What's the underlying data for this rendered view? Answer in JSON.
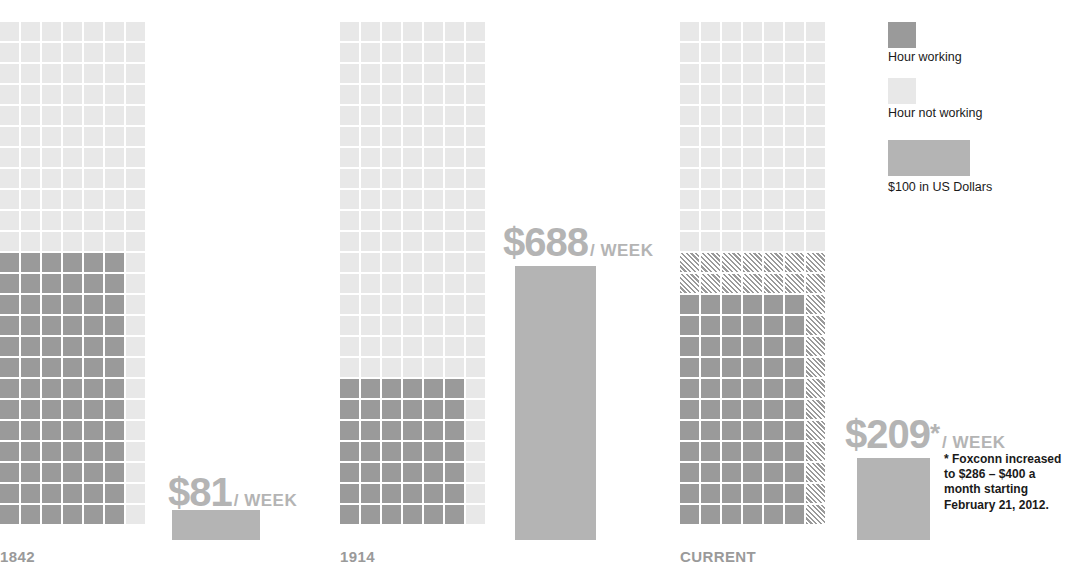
{
  "chart_data": {
    "type": "bar",
    "title": "",
    "subtitle": "",
    "xlabel": "",
    "ylabel": "",
    "categories": [
      "1842",
      "1914",
      "CURRENT"
    ],
    "series": [
      {
        "name": "Weekly wage (US Dollars)",
        "values": [
          81,
          688,
          209
        ],
        "labels": [
          "$81",
          "$688",
          "$209"
        ]
      },
      {
        "name": "Hours working per week",
        "values": [
          78,
          42,
          78
        ],
        "note": "waffle grid: dark cells = hours working"
      },
      {
        "name": "Hours not working per week",
        "values": [
          90,
          126,
          90
        ],
        "note": "waffle grid: light cells = hours not working"
      }
    ],
    "waffle": {
      "columns": 7,
      "rows": 24,
      "groups": [
        {
          "category": "1842",
          "off_rows": 11,
          "hatch_rows": 0,
          "on_rows": 13,
          "on_cols": 6,
          "tail_state": "off"
        },
        {
          "category": "1914",
          "off_rows": 17,
          "hatch_rows": 0,
          "on_rows": 7,
          "on_cols": 6,
          "tail_state": "off"
        },
        {
          "category": "CURRENT",
          "off_rows": 11,
          "hatch_rows": 2,
          "on_rows": 11,
          "on_cols": 6,
          "tail_state": "hatch"
        }
      ]
    },
    "legend": {
      "position": "top-right",
      "entries": [
        {
          "label": "Hour working",
          "swatch": "solid-dark",
          "color": "#9a9a9a"
        },
        {
          "label": "Hour not working",
          "swatch": "solid-light",
          "color": "#e8e8e8"
        },
        {
          "label": "$100 in US Dollars",
          "swatch": "money-bar",
          "color": "#b4b4b4"
        }
      ]
    },
    "grid": false,
    "annotations": [
      "* Foxconn increased to $286 – $400 a month starting February 21, 2012."
    ]
  },
  "groups": [
    {
      "axis_label": "1842",
      "value_amount": "$81",
      "value_star": "",
      "value_per": "/ WEEK"
    },
    {
      "axis_label": "1914",
      "value_amount": "$688",
      "value_star": "",
      "value_per": "/ WEEK"
    },
    {
      "axis_label": "CURRENT",
      "value_amount": "$209",
      "value_star": "*",
      "value_per": "/ WEEK"
    }
  ],
  "legend": {
    "working_label": "Hour working",
    "not_working_label": "Hour not working",
    "money_label": "$100 in US Dollars"
  },
  "footnote": {
    "text": "* Foxconn increased to $286 – $400 a month starting February 21, 2012."
  },
  "colors": {
    "working": "#9a9a9a",
    "not_working": "#e8e8e8",
    "money": "#b4b4b4",
    "axis_text": "#9a9a9a",
    "body_text": "#1a1a1a",
    "background": "#ffffff"
  }
}
